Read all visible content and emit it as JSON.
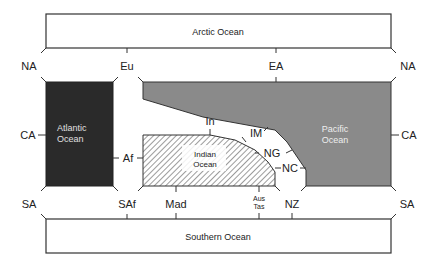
{
  "diagram": {
    "colors": {
      "atlantic_fill": "#2a2a2a",
      "pacific_fill": "#8a8a8a",
      "indian_hatch": "#666666",
      "line": "#333333",
      "inner_text_light": "#e8e8e8"
    },
    "oceans": {
      "arctic": "Arctic Ocean",
      "southern": "Southern Ocean",
      "atlantic_line1": "Atlantic",
      "atlantic_line2": "Ocean",
      "pacific_line1": "Pacific",
      "pacific_line2": "Ocean",
      "indian_line1": "Indian",
      "indian_line2": "Ocean"
    },
    "landmasses": {
      "na_left": "NA",
      "na_right": "NA",
      "eu": "Eu",
      "ea": "EA",
      "ca_left": "CA",
      "ca_right": "CA",
      "af": "Af",
      "in": "In",
      "im": "IM",
      "ng": "NG",
      "nc": "NC",
      "sa_left": "SA",
      "sa_right": "SA",
      "saf": "SAf",
      "mad": "Mad",
      "aus_line1": "Aus",
      "aus_line2": "Tas",
      "nz": "NZ"
    }
  }
}
